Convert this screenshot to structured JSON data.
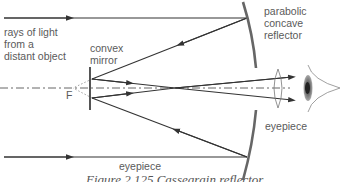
{
  "diagram": {
    "title": "Cassegrain reflector",
    "labels": {
      "rays": "rays of light\nfrom a\ndistant object",
      "convex_mirror": "convex\nmirror",
      "concave_reflector": "parabolic\nconcave\nreflector",
      "eyepiece_right": "eyepiece",
      "eyepiece_bottom": "eyepiece",
      "focus": "F"
    },
    "caption": "Figure 2.125   Cassegrain reflector",
    "colors": {
      "ray": "#333333",
      "mirror": "#666666",
      "text": "#5a5a5a",
      "axis": "#555555"
    }
  }
}
